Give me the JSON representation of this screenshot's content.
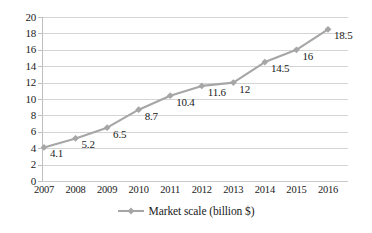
{
  "chart_data": {
    "type": "line",
    "title": "",
    "xlabel": "",
    "ylabel": "",
    "categories": [
      "2007",
      "2008",
      "2009",
      "2010",
      "2011",
      "2012",
      "2013",
      "2014",
      "2015",
      "2016"
    ],
    "series": [
      {
        "name": "Market scale (billion $)",
        "values": [
          4.1,
          5.2,
          6.5,
          8.7,
          10.4,
          11.6,
          12,
          14.5,
          16,
          18.5
        ],
        "point_labels": [
          "4.1",
          "5.2",
          "6.5",
          "8.7",
          "10.4",
          "11.6",
          "12",
          "14.5",
          "16",
          "18.5"
        ],
        "color": "#a6a6a6",
        "marker": "diamond"
      }
    ],
    "ylim": [
      0,
      20
    ],
    "yticks": [
      0,
      2,
      4,
      6,
      8,
      10,
      12,
      14,
      16,
      18,
      20
    ],
    "ytick_labels": [
      "0",
      "2",
      "4",
      "6",
      "8",
      "10",
      "12",
      "14",
      "16",
      "18",
      "20"
    ],
    "grid": "horizontal",
    "legend_position": "bottom",
    "legend": [
      "Market scale (billion $)"
    ],
    "colors": {
      "series": "#a6a6a6",
      "gridline": "#d4d4d4",
      "axis": "#bfbfbf",
      "text": "#1a1a1a",
      "background": "#ffffff"
    }
  }
}
